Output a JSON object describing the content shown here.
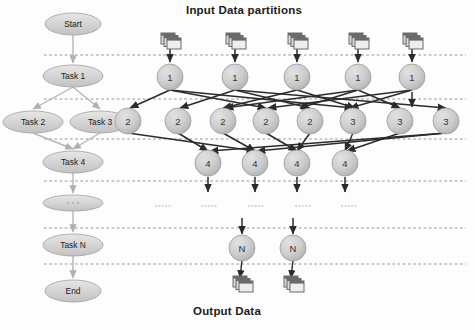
{
  "titles": {
    "input": "Input Data partitions",
    "output": "Output Data"
  },
  "colors": {
    "node_fill": "#c9c9c9",
    "node_stroke": "#9a9a9a",
    "task_fill": "#d0d0d0",
    "task_stroke": "#a8a8a8",
    "edge_dark": "#2b2b2b",
    "edge_light": "#b5b5b5",
    "dashed_line": "#6f6fa8",
    "text": "#1b1b1b",
    "icon_dark": "#6a6a6a",
    "icon_light": "#d8d8d8"
  },
  "workflow": {
    "nodes": [
      {
        "id": "start",
        "label": "Start",
        "x": 73,
        "y": 24,
        "rx": 28,
        "ry": 11
      },
      {
        "id": "task1",
        "label": "Task 1",
        "x": 73,
        "y": 76,
        "rx": 30,
        "ry": 11
      },
      {
        "id": "task2",
        "label": "Task 2",
        "x": 33,
        "y": 122,
        "rx": 30,
        "ry": 11
      },
      {
        "id": "task3",
        "label": "Task 3",
        "x": 100,
        "y": 122,
        "rx": 30,
        "ry": 11
      },
      {
        "id": "task4",
        "label": "Task 4",
        "x": 73,
        "y": 162,
        "rx": 30,
        "ry": 11
      },
      {
        "id": "dots",
        "label": "",
        "x": 73,
        "y": 203,
        "rx": 30,
        "ry": 8
      },
      {
        "id": "taskN",
        "label": "Task N",
        "x": 73,
        "y": 245,
        "rx": 30,
        "ry": 11
      },
      {
        "id": "end",
        "label": "End",
        "x": 73,
        "y": 291,
        "rx": 28,
        "ry": 11
      }
    ],
    "edges": [
      {
        "from": "start",
        "to": "task1"
      },
      {
        "from": "task1",
        "to": "task2"
      },
      {
        "from": "task1",
        "to": "task3"
      },
      {
        "from": "task2",
        "to": "task4"
      },
      {
        "from": "task3",
        "to": "task4"
      },
      {
        "from": "task4",
        "to": "dots"
      },
      {
        "from": "dots",
        "to": "taskN"
      },
      {
        "from": "taskN",
        "to": "end"
      }
    ]
  },
  "stage_lines": [
    {
      "y": 55
    },
    {
      "y": 99
    },
    {
      "y": 139
    },
    {
      "y": 181
    },
    {
      "y": 228
    },
    {
      "y": 264
    }
  ],
  "input_icons": [
    {
      "x": 170,
      "y": 41
    },
    {
      "x": 235,
      "y": 41
    },
    {
      "x": 297,
      "y": 41
    },
    {
      "x": 358,
      "y": 41
    },
    {
      "x": 412,
      "y": 41
    }
  ],
  "output_icons": [
    {
      "x": 242,
      "y": 284
    },
    {
      "x": 293,
      "y": 284
    }
  ],
  "task_rows": [
    {
      "row": "row1",
      "radius": 13,
      "y": 77,
      "nodes": [
        {
          "label": "1",
          "x": 170
        },
        {
          "label": "1",
          "x": 235
        },
        {
          "label": "1",
          "x": 297
        },
        {
          "label": "1",
          "x": 358
        },
        {
          "label": "1",
          "x": 412
        }
      ]
    },
    {
      "row": "row2",
      "radius": 13,
      "y": 121,
      "nodes": [
        {
          "label": "2",
          "x": 128
        },
        {
          "label": "2",
          "x": 178
        },
        {
          "label": "2",
          "x": 223
        },
        {
          "label": "2",
          "x": 266
        },
        {
          "label": "2",
          "x": 310
        },
        {
          "label": "3",
          "x": 353
        },
        {
          "label": "3",
          "x": 400
        },
        {
          "label": "3",
          "x": 446
        }
      ]
    },
    {
      "row": "row3",
      "radius": 13,
      "y": 163,
      "nodes": [
        {
          "label": "4",
          "x": 208
        },
        {
          "label": "4",
          "x": 255
        },
        {
          "label": "4",
          "x": 297
        },
        {
          "label": "4",
          "x": 345
        }
      ]
    },
    {
      "row": "rowN",
      "radius": 13,
      "y": 248,
      "nodes": [
        {
          "label": "N",
          "x": 242
        },
        {
          "label": "N",
          "x": 293
        }
      ]
    }
  ],
  "ellipsis_marks": [
    {
      "x": 162,
      "y": 205
    },
    {
      "x": 208,
      "y": 205
    },
    {
      "x": 255,
      "y": 205
    },
    {
      "x": 302,
      "y": 205
    },
    {
      "x": 348,
      "y": 205
    }
  ],
  "vertical_arrows": [
    {
      "x": 170,
      "y1": 48,
      "y2": 62
    },
    {
      "x": 235,
      "y1": 48,
      "y2": 62
    },
    {
      "x": 297,
      "y1": 48,
      "y2": 62
    },
    {
      "x": 358,
      "y1": 48,
      "y2": 62
    },
    {
      "x": 412,
      "y1": 48,
      "y2": 62
    },
    {
      "x": 412,
      "y1": 92,
      "y2": 107
    },
    {
      "x": 208,
      "y1": 177,
      "y2": 192
    },
    {
      "x": 255,
      "y1": 177,
      "y2": 192
    },
    {
      "x": 297,
      "y1": 177,
      "y2": 192
    },
    {
      "x": 345,
      "y1": 177,
      "y2": 192
    },
    {
      "x": 242,
      "y1": 218,
      "y2": 234
    },
    {
      "x": 293,
      "y1": 218,
      "y2": 234
    }
  ],
  "shuffle_edges_a": [
    {
      "x1": 170,
      "y1": 90,
      "x2": 130,
      "y2": 108
    },
    {
      "x1": 170,
      "y1": 90,
      "x2": 266,
      "y2": 108
    },
    {
      "x1": 170,
      "y1": 90,
      "x2": 353,
      "y2": 108
    },
    {
      "x1": 235,
      "y1": 90,
      "x2": 180,
      "y2": 108
    },
    {
      "x1": 235,
      "y1": 90,
      "x2": 310,
      "y2": 108
    },
    {
      "x1": 235,
      "y1": 90,
      "x2": 446,
      "y2": 108
    },
    {
      "x1": 297,
      "y1": 90,
      "x2": 223,
      "y2": 108
    },
    {
      "x1": 297,
      "y1": 90,
      "x2": 355,
      "y2": 108
    },
    {
      "x1": 358,
      "y1": 90,
      "x2": 225,
      "y2": 108
    },
    {
      "x1": 358,
      "y1": 90,
      "x2": 300,
      "y2": 108
    },
    {
      "x1": 358,
      "y1": 90,
      "x2": 400,
      "y2": 108
    },
    {
      "x1": 412,
      "y1": 90,
      "x2": 268,
      "y2": 108
    },
    {
      "x1": 412,
      "y1": 90,
      "x2": 350,
      "y2": 108
    }
  ],
  "shuffle_edges_b": [
    {
      "x1": 128,
      "y1": 133,
      "x2": 255,
      "y2": 151
    },
    {
      "x1": 178,
      "y1": 133,
      "x2": 208,
      "y2": 151
    },
    {
      "x1": 223,
      "y1": 133,
      "x2": 255,
      "y2": 151
    },
    {
      "x1": 266,
      "y1": 133,
      "x2": 297,
      "y2": 151
    },
    {
      "x1": 310,
      "y1": 133,
      "x2": 297,
      "y2": 151
    },
    {
      "x1": 353,
      "y1": 133,
      "x2": 345,
      "y2": 151
    },
    {
      "x1": 400,
      "y1": 133,
      "x2": 347,
      "y2": 151
    },
    {
      "x1": 446,
      "y1": 133,
      "x2": 257,
      "y2": 151
    },
    {
      "x1": 446,
      "y1": 133,
      "x2": 210,
      "y2": 151
    }
  ],
  "output_links": [
    {
      "x1": 242,
      "y1": 260,
      "x2": 240,
      "y2": 278
    },
    {
      "x1": 293,
      "y1": 260,
      "x2": 291,
      "y2": 278
    }
  ]
}
